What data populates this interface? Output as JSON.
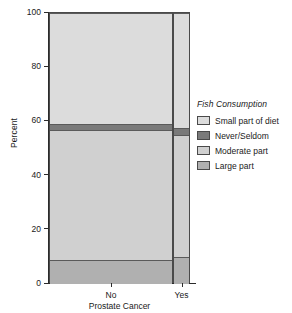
{
  "chart_data": {
    "type": "bar",
    "title": "",
    "subtitle": "",
    "xlabel": "Prostate Cancer",
    "ylabel": "Percent",
    "categories": [
      "No",
      "Yes"
    ],
    "ylim": [
      0,
      100
    ],
    "yticks": [
      "0",
      "20",
      "40",
      "60",
      "80",
      "100"
    ],
    "grid": false,
    "stacked": true,
    "stack_percent": true,
    "legend_position": "right",
    "legend_title": "Fish Consumption",
    "category_widths": [
      88,
      12
    ],
    "series": [
      {
        "name": "Small part of diet",
        "color": "#dcdcdc",
        "values": [
          41.0,
          42.5
        ]
      },
      {
        "name": "Never/Seldom",
        "color": "#7a7a7a",
        "values": [
          2.0,
          2.5
        ]
      },
      {
        "name": "Moderate part",
        "color": "#d0d0d0",
        "values": [
          48.0,
          45.0
        ]
      },
      {
        "name": "Large part",
        "color": "#b0b0b0",
        "values": [
          9.0,
          10.0
        ]
      }
    ],
    "stack_order_bottom_to_top": [
      "Large part",
      "Moderate part",
      "Never/Seldom",
      "Small part of diet"
    ]
  },
  "axes": {
    "y": {
      "title": "Percent",
      "ticks": [
        {
          "label": "100",
          "value": 100
        },
        {
          "label": "80",
          "value": 80
        },
        {
          "label": "60",
          "value": 60
        },
        {
          "label": "40",
          "value": 40
        },
        {
          "label": "20",
          "value": 20
        },
        {
          "label": "0",
          "value": 0
        }
      ]
    },
    "x": {
      "title": "Prostate Cancer",
      "ticks": [
        {
          "label": "No"
        },
        {
          "label": "Yes"
        }
      ]
    }
  },
  "legend": {
    "title": "Fish Consumption",
    "items": [
      {
        "label": "Small part of diet",
        "color": "#dcdcdc"
      },
      {
        "label": "Never/Seldom",
        "color": "#7a7a7a"
      },
      {
        "label": "Moderate part",
        "color": "#d0d0d0"
      },
      {
        "label": "Large part",
        "color": "#b0b0b0"
      }
    ]
  }
}
